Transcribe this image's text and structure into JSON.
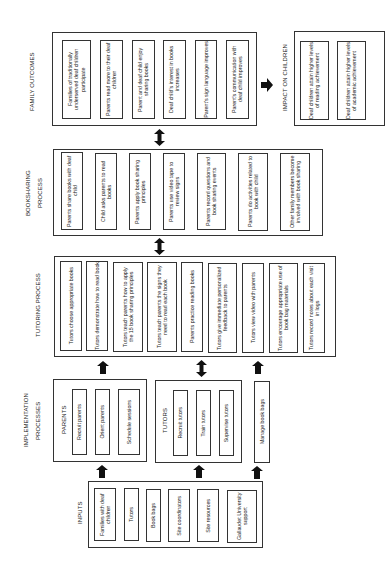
{
  "family_outcomes": {
    "label": "FAMILY OUTCOMES",
    "items": [
      "Families of traditionally underserved deaf children participate",
      "Parents read more to their deaf children",
      "Parent and deaf child enjoy sharing books",
      "Deaf child's interest in books increases",
      "Parent's sign language improves",
      "Parent's communication with deaf child improves"
    ]
  },
  "impact": {
    "label": "IMPACT ON CHILDREN",
    "items": [
      "Deaf children attain higher levels of reading achievement",
      "Deaf children attain higher levels of academic achievement"
    ]
  },
  "bookshare": {
    "label": "BOOKSHARING PROCESS",
    "items": [
      "Parents share books with deaf child",
      "Child asks parents to read books",
      "Parents apply book sharing principles",
      "Parents use video tape to review signs",
      "Parents record questions and book sharing events",
      "Parents do activities related to book with child",
      "Other family members become involved with book sharing"
    ]
  },
  "tutoring": {
    "label": "TUTORING PROCESS",
    "items": [
      "Tutors choose appropriate books",
      "Tutors demonstrate how to read book",
      "Tutors teach parents how to apply the 15 book sharing principles",
      "Tutors teach parents the signs they need to read each book",
      "Parents practice reading books",
      "Tutors give immediate personalized feedback to parents",
      "Tutors view video with parents",
      "Tutors encourage appropriate use of book bag materials",
      "Tutors record notes about each visit in logs"
    ]
  },
  "implementation": {
    "label": "IMPLEMENTATION PROCESSES",
    "parents": {
      "label": "PARENTS",
      "items": [
        "Recruit parents",
        "Orient parents",
        "Schedule sessions"
      ]
    },
    "tutors": {
      "label": "TUTORS",
      "items": [
        "Recruit tutors",
        "Train tutors",
        "Supervise tutors"
      ]
    },
    "book_bags": "Manage book bags"
  },
  "inputs": {
    "label": "INPUTS",
    "items": [
      "Families with deaf children",
      "Tutors",
      "Book bags",
      "Site coordinators",
      "Site resources",
      "Gallaudet University support"
    ]
  }
}
